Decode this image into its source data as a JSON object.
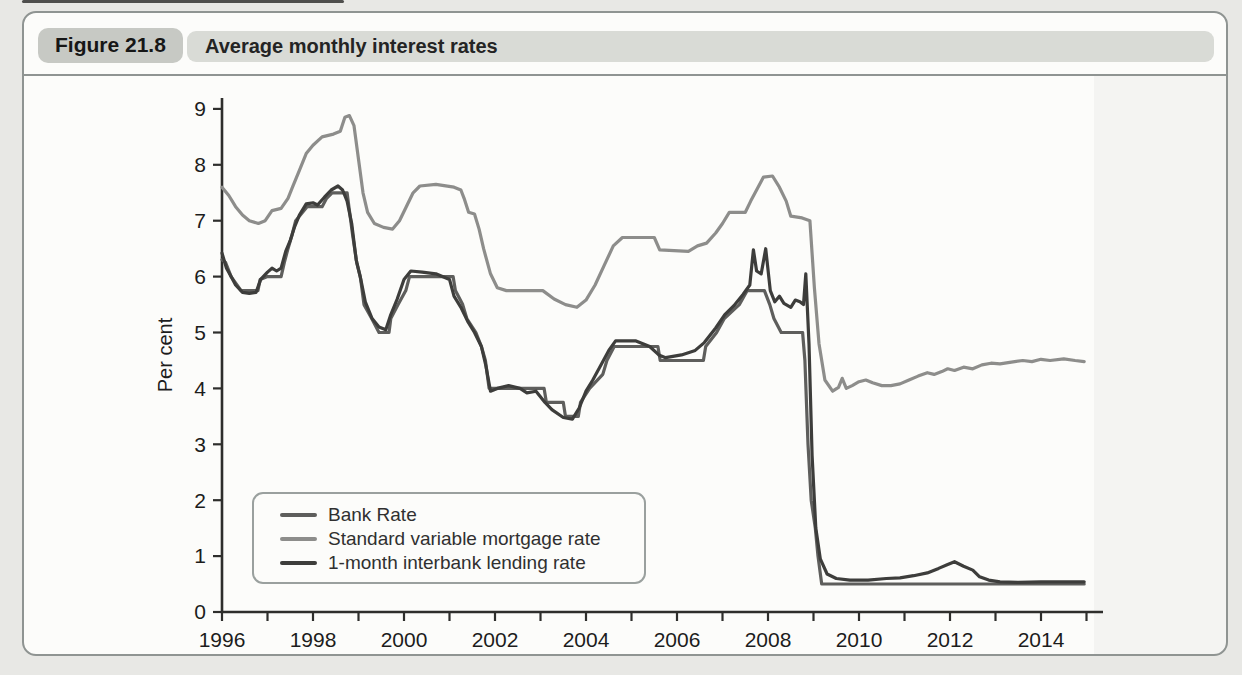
{
  "figure": {
    "label": "Figure 21.8",
    "title": "Average monthly interest rates"
  },
  "chart_data": {
    "type": "line",
    "title": "Average monthly interest rates",
    "xlabel": "",
    "ylabel": "Per cent",
    "xlim": [
      1996,
      2015.3
    ],
    "ylim": [
      0,
      9
    ],
    "grid": false,
    "legend_position": "lower left inside",
    "x_axis": {
      "min": 1996,
      "major_ticks": [
        1996,
        1998,
        2000,
        2002,
        2004,
        2006,
        2008,
        2010,
        2012,
        2014
      ],
      "minor_tick_step": 1,
      "minor_tick_end": 2015
    },
    "y_axis": {
      "ticks": [
        0,
        1,
        2,
        3,
        4,
        5,
        6,
        7,
        8,
        9
      ]
    },
    "axis_color": "#2e2e2c",
    "tick_label_color": "#1c1c1c",
    "series": [
      {
        "name": "Bank Rate",
        "color": "#5e5e5c",
        "points": [
          [
            1996.0,
            6.3
          ],
          [
            1996.08,
            6.25
          ],
          [
            1996.2,
            6.0
          ],
          [
            1996.42,
            5.75
          ],
          [
            1996.79,
            5.75
          ],
          [
            1996.84,
            5.95
          ],
          [
            1997.0,
            6.0
          ],
          [
            1997.3,
            6.0
          ],
          [
            1997.37,
            6.25
          ],
          [
            1997.45,
            6.5
          ],
          [
            1997.54,
            6.75
          ],
          [
            1997.62,
            7.0
          ],
          [
            1997.87,
            7.25
          ],
          [
            1998.2,
            7.25
          ],
          [
            1998.3,
            7.4
          ],
          [
            1998.42,
            7.5
          ],
          [
            1998.75,
            7.5
          ],
          [
            1998.79,
            7.25
          ],
          [
            1998.87,
            6.75
          ],
          [
            1998.96,
            6.25
          ],
          [
            1999.04,
            6.0
          ],
          [
            1999.12,
            5.5
          ],
          [
            1999.29,
            5.25
          ],
          [
            1999.45,
            5.0
          ],
          [
            1999.67,
            5.0
          ],
          [
            1999.71,
            5.25
          ],
          [
            1999.87,
            5.5
          ],
          [
            2000.04,
            5.75
          ],
          [
            2000.12,
            6.0
          ],
          [
            2001.08,
            6.0
          ],
          [
            2001.13,
            5.75
          ],
          [
            2001.29,
            5.5
          ],
          [
            2001.38,
            5.25
          ],
          [
            2001.58,
            5.0
          ],
          [
            2001.7,
            4.75
          ],
          [
            2001.79,
            4.5
          ],
          [
            2001.87,
            4.0
          ],
          [
            2003.08,
            4.0
          ],
          [
            2003.13,
            3.75
          ],
          [
            2003.5,
            3.75
          ],
          [
            2003.55,
            3.5
          ],
          [
            2003.83,
            3.5
          ],
          [
            2003.88,
            3.75
          ],
          [
            2004.08,
            4.0
          ],
          [
            2004.37,
            4.25
          ],
          [
            2004.46,
            4.5
          ],
          [
            2004.62,
            4.75
          ],
          [
            2005.58,
            4.75
          ],
          [
            2005.63,
            4.5
          ],
          [
            2006.58,
            4.5
          ],
          [
            2006.63,
            4.75
          ],
          [
            2006.87,
            5.0
          ],
          [
            2007.04,
            5.25
          ],
          [
            2007.37,
            5.5
          ],
          [
            2007.54,
            5.75
          ],
          [
            2007.92,
            5.75
          ],
          [
            2008.04,
            5.5
          ],
          [
            2008.13,
            5.25
          ],
          [
            2008.29,
            5.0
          ],
          [
            2008.76,
            5.0
          ],
          [
            2008.81,
            4.5
          ],
          [
            2008.88,
            3.0
          ],
          [
            2008.95,
            2.0
          ],
          [
            2009.04,
            1.5
          ],
          [
            2009.1,
            1.0
          ],
          [
            2009.18,
            0.5
          ],
          [
            2014.95,
            0.5
          ]
        ]
      },
      {
        "name": "Standard variable mortgage rate",
        "color": "#8d8d8b",
        "points": [
          [
            1996.0,
            7.6
          ],
          [
            1996.15,
            7.45
          ],
          [
            1996.3,
            7.25
          ],
          [
            1996.45,
            7.1
          ],
          [
            1996.6,
            7.0
          ],
          [
            1996.8,
            6.95
          ],
          [
            1996.95,
            7.0
          ],
          [
            1997.1,
            7.18
          ],
          [
            1997.3,
            7.22
          ],
          [
            1997.45,
            7.4
          ],
          [
            1997.55,
            7.6
          ],
          [
            1997.7,
            7.9
          ],
          [
            1997.85,
            8.2
          ],
          [
            1998.0,
            8.35
          ],
          [
            1998.2,
            8.5
          ],
          [
            1998.45,
            8.55
          ],
          [
            1998.6,
            8.6
          ],
          [
            1998.7,
            8.85
          ],
          [
            1998.8,
            8.88
          ],
          [
            1998.9,
            8.7
          ],
          [
            1999.0,
            8.1
          ],
          [
            1999.1,
            7.5
          ],
          [
            1999.2,
            7.15
          ],
          [
            1999.35,
            6.95
          ],
          [
            1999.55,
            6.88
          ],
          [
            1999.75,
            6.85
          ],
          [
            1999.9,
            7.0
          ],
          [
            2000.05,
            7.25
          ],
          [
            2000.2,
            7.5
          ],
          [
            2000.35,
            7.62
          ],
          [
            2000.7,
            7.65
          ],
          [
            2001.1,
            7.6
          ],
          [
            2001.25,
            7.55
          ],
          [
            2001.32,
            7.4
          ],
          [
            2001.42,
            7.15
          ],
          [
            2001.55,
            7.12
          ],
          [
            2001.65,
            6.85
          ],
          [
            2001.75,
            6.5
          ],
          [
            2001.9,
            6.05
          ],
          [
            2002.05,
            5.8
          ],
          [
            2002.25,
            5.75
          ],
          [
            2003.05,
            5.75
          ],
          [
            2003.3,
            5.6
          ],
          [
            2003.55,
            5.5
          ],
          [
            2003.8,
            5.45
          ],
          [
            2004.0,
            5.58
          ],
          [
            2004.2,
            5.85
          ],
          [
            2004.4,
            6.2
          ],
          [
            2004.6,
            6.55
          ],
          [
            2004.8,
            6.7
          ],
          [
            2005.5,
            6.7
          ],
          [
            2005.62,
            6.48
          ],
          [
            2006.25,
            6.45
          ],
          [
            2006.45,
            6.55
          ],
          [
            2006.65,
            6.6
          ],
          [
            2006.85,
            6.78
          ],
          [
            2007.0,
            6.95
          ],
          [
            2007.15,
            7.15
          ],
          [
            2007.5,
            7.15
          ],
          [
            2007.62,
            7.35
          ],
          [
            2007.75,
            7.55
          ],
          [
            2007.9,
            7.78
          ],
          [
            2008.1,
            7.8
          ],
          [
            2008.25,
            7.6
          ],
          [
            2008.4,
            7.35
          ],
          [
            2008.5,
            7.08
          ],
          [
            2008.75,
            7.05
          ],
          [
            2008.92,
            7.0
          ],
          [
            2009.02,
            5.8
          ],
          [
            2009.12,
            4.8
          ],
          [
            2009.25,
            4.15
          ],
          [
            2009.42,
            3.95
          ],
          [
            2009.55,
            4.02
          ],
          [
            2009.63,
            4.18
          ],
          [
            2009.72,
            4.0
          ],
          [
            2009.85,
            4.05
          ],
          [
            2010.0,
            4.12
          ],
          [
            2010.15,
            4.15
          ],
          [
            2010.3,
            4.1
          ],
          [
            2010.5,
            4.05
          ],
          [
            2010.7,
            4.05
          ],
          [
            2010.9,
            4.08
          ],
          [
            2011.1,
            4.15
          ],
          [
            2011.3,
            4.22
          ],
          [
            2011.5,
            4.28
          ],
          [
            2011.65,
            4.25
          ],
          [
            2011.82,
            4.3
          ],
          [
            2011.95,
            4.35
          ],
          [
            2012.1,
            4.32
          ],
          [
            2012.3,
            4.38
          ],
          [
            2012.5,
            4.35
          ],
          [
            2012.7,
            4.42
          ],
          [
            2012.9,
            4.45
          ],
          [
            2013.1,
            4.44
          ],
          [
            2013.35,
            4.47
          ],
          [
            2013.6,
            4.5
          ],
          [
            2013.8,
            4.48
          ],
          [
            2014.0,
            4.52
          ],
          [
            2014.2,
            4.5
          ],
          [
            2014.5,
            4.53
          ],
          [
            2014.75,
            4.5
          ],
          [
            2014.95,
            4.48
          ]
        ]
      },
      {
        "name": "1-month interbank lending rate",
        "color": "#3d3d3b",
        "points": [
          [
            1996.0,
            6.42
          ],
          [
            1996.1,
            6.15
          ],
          [
            1996.2,
            6.0
          ],
          [
            1996.3,
            5.85
          ],
          [
            1996.45,
            5.72
          ],
          [
            1996.6,
            5.7
          ],
          [
            1996.75,
            5.72
          ],
          [
            1996.85,
            5.95
          ],
          [
            1997.0,
            6.08
          ],
          [
            1997.1,
            6.15
          ],
          [
            1997.2,
            6.1
          ],
          [
            1997.3,
            6.15
          ],
          [
            1997.4,
            6.45
          ],
          [
            1997.5,
            6.65
          ],
          [
            1997.6,
            6.9
          ],
          [
            1997.7,
            7.1
          ],
          [
            1997.85,
            7.3
          ],
          [
            1998.0,
            7.32
          ],
          [
            1998.1,
            7.28
          ],
          [
            1998.25,
            7.42
          ],
          [
            1998.4,
            7.55
          ],
          [
            1998.55,
            7.62
          ],
          [
            1998.65,
            7.55
          ],
          [
            1998.75,
            7.35
          ],
          [
            1998.85,
            6.95
          ],
          [
            1998.95,
            6.3
          ],
          [
            1999.05,
            5.95
          ],
          [
            1999.15,
            5.55
          ],
          [
            1999.3,
            5.25
          ],
          [
            1999.45,
            5.1
          ],
          [
            1999.6,
            5.05
          ],
          [
            1999.7,
            5.3
          ],
          [
            1999.85,
            5.6
          ],
          [
            2000.0,
            5.95
          ],
          [
            2000.15,
            6.1
          ],
          [
            2000.4,
            6.08
          ],
          [
            2000.7,
            6.05
          ],
          [
            2001.0,
            5.95
          ],
          [
            2001.1,
            5.65
          ],
          [
            2001.25,
            5.45
          ],
          [
            2001.4,
            5.2
          ],
          [
            2001.55,
            5.0
          ],
          [
            2001.7,
            4.75
          ],
          [
            2001.8,
            4.4
          ],
          [
            2001.9,
            3.95
          ],
          [
            2002.05,
            4.0
          ],
          [
            2002.3,
            4.05
          ],
          [
            2002.55,
            4.0
          ],
          [
            2002.7,
            3.92
          ],
          [
            2002.9,
            3.95
          ],
          [
            2003.1,
            3.75
          ],
          [
            2003.25,
            3.62
          ],
          [
            2003.5,
            3.48
          ],
          [
            2003.7,
            3.45
          ],
          [
            2003.85,
            3.65
          ],
          [
            2004.0,
            3.95
          ],
          [
            2004.15,
            4.15
          ],
          [
            2004.35,
            4.45
          ],
          [
            2004.5,
            4.68
          ],
          [
            2004.65,
            4.85
          ],
          [
            2005.1,
            4.85
          ],
          [
            2005.4,
            4.75
          ],
          [
            2005.6,
            4.6
          ],
          [
            2005.75,
            4.55
          ],
          [
            2006.1,
            4.6
          ],
          [
            2006.4,
            4.68
          ],
          [
            2006.6,
            4.82
          ],
          [
            2006.85,
            5.08
          ],
          [
            2007.05,
            5.32
          ],
          [
            2007.25,
            5.48
          ],
          [
            2007.45,
            5.68
          ],
          [
            2007.6,
            5.85
          ],
          [
            2007.68,
            6.48
          ],
          [
            2007.75,
            6.1
          ],
          [
            2007.85,
            6.05
          ],
          [
            2007.95,
            6.5
          ],
          [
            2008.05,
            5.75
          ],
          [
            2008.15,
            5.55
          ],
          [
            2008.25,
            5.65
          ],
          [
            2008.35,
            5.52
          ],
          [
            2008.5,
            5.45
          ],
          [
            2008.6,
            5.58
          ],
          [
            2008.7,
            5.55
          ],
          [
            2008.78,
            5.5
          ],
          [
            2008.83,
            6.05
          ],
          [
            2008.9,
            4.8
          ],
          [
            2008.97,
            2.8
          ],
          [
            2009.05,
            1.5
          ],
          [
            2009.15,
            0.95
          ],
          [
            2009.3,
            0.68
          ],
          [
            2009.5,
            0.6
          ],
          [
            2009.8,
            0.57
          ],
          [
            2010.2,
            0.57
          ],
          [
            2010.6,
            0.6
          ],
          [
            2010.9,
            0.61
          ],
          [
            2011.2,
            0.65
          ],
          [
            2011.5,
            0.7
          ],
          [
            2011.75,
            0.78
          ],
          [
            2011.95,
            0.85
          ],
          [
            2012.1,
            0.9
          ],
          [
            2012.3,
            0.82
          ],
          [
            2012.5,
            0.75
          ],
          [
            2012.65,
            0.63
          ],
          [
            2012.85,
            0.57
          ],
          [
            2013.1,
            0.54
          ],
          [
            2013.5,
            0.53
          ],
          [
            2014.0,
            0.54
          ],
          [
            2014.95,
            0.54
          ]
        ]
      }
    ]
  }
}
